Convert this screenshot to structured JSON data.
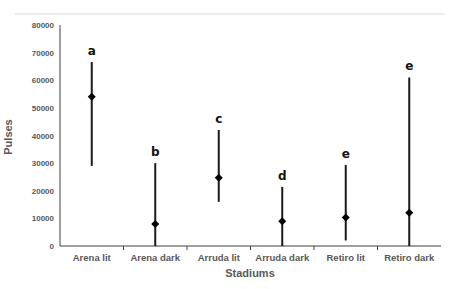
{
  "chart_data": {
    "type": "errorbar",
    "title": "",
    "xlabel": "Stadiums",
    "ylabel": "Pulses",
    "ylim": [
      0,
      80000
    ],
    "yticks": [
      0,
      10000,
      20000,
      30000,
      40000,
      50000,
      60000,
      70000,
      80000
    ],
    "grid": false,
    "legend": null,
    "categories": [
      "Arena lit",
      "Arena dark",
      "Arruda lit",
      "Arruda dark",
      "Retiro lit",
      "Retiro dark"
    ],
    "series": [
      {
        "name": "Pulses",
        "values": [
          54000,
          8000,
          24700,
          9000,
          10300,
          12000
        ],
        "upper": [
          66600,
          30000,
          42000,
          21400,
          29300,
          61000
        ],
        "lower": [
          29000,
          0,
          16000,
          0,
          2000,
          0
        ]
      }
    ],
    "annotations": [
      "a",
      "b",
      "c",
      "d",
      "e",
      "e"
    ]
  },
  "colors": {
    "marker": "#000000",
    "errorbar": "#1a1a1a",
    "axis": "#404040",
    "text": "#595959",
    "top_rule": "#d9d9d9"
  }
}
